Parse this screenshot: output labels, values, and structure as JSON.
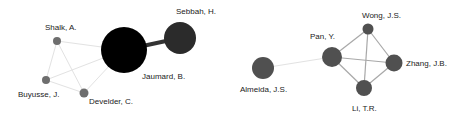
{
  "networks": [
    {
      "nodes": [
        {
          "id": "shalk",
          "label": "Shalk, A.",
          "x": 57,
          "y": 41,
          "r": 4,
          "color": "#6e6e6e"
        },
        {
          "id": "buyusse",
          "label": "Buyusse, J.",
          "x": 46,
          "y": 80,
          "r": 4,
          "color": "#6e6e6e"
        },
        {
          "id": "develder",
          "label": "Develder, C.",
          "x": 84,
          "y": 93,
          "r": 4.5,
          "color": "#6e6e6e"
        },
        {
          "id": "jaumard",
          "label": "Jaumard, B.",
          "x": 124,
          "y": 50,
          "r": 23,
          "color": "#000000"
        },
        {
          "id": "sebbah",
          "label": "Sebbah, H.",
          "x": 180,
          "y": 38,
          "r": 16,
          "color": "#2b2b2b"
        }
      ],
      "edges": [
        {
          "from": "jaumard",
          "to": "sebbah",
          "width": 4,
          "color": "#333333"
        },
        {
          "from": "shalk",
          "to": "jaumard",
          "width": 1,
          "color": "#e2e2e2"
        },
        {
          "from": "buyusse",
          "to": "jaumard",
          "width": 1,
          "color": "#e2e2e2"
        },
        {
          "from": "develder",
          "to": "jaumard",
          "width": 1,
          "color": "#e2e2e2"
        },
        {
          "from": "shalk",
          "to": "buyusse",
          "width": 1,
          "color": "#e2e2e2"
        },
        {
          "from": "shalk",
          "to": "develder",
          "width": 1,
          "color": "#e2e2e2"
        },
        {
          "from": "buyusse",
          "to": "develder",
          "width": 1,
          "color": "#e2e2e2"
        }
      ]
    },
    {
      "nodes": [
        {
          "id": "almeida",
          "label": "Almeida, J.S.",
          "x": 263,
          "y": 68,
          "r": 11,
          "color": "#505050"
        },
        {
          "id": "pan",
          "label": "Pan, Y.",
          "x": 332,
          "y": 57,
          "r": 10,
          "color": "#505050"
        },
        {
          "id": "wong",
          "label": "Wong, J.S.",
          "x": 368,
          "y": 29,
          "r": 5.5,
          "color": "#505050"
        },
        {
          "id": "zhang",
          "label": "Zhang, J.B.",
          "x": 394,
          "y": 63,
          "r": 8.5,
          "color": "#505050"
        },
        {
          "id": "li",
          "label": "Li, T.R.",
          "x": 364,
          "y": 88,
          "r": 8,
          "color": "#505050"
        }
      ],
      "edges": [
        {
          "from": "almeida",
          "to": "pan",
          "width": 1,
          "color": "#e2e2e2"
        },
        {
          "from": "pan",
          "to": "wong",
          "width": 1.2,
          "color": "#a8a8a8"
        },
        {
          "from": "pan",
          "to": "zhang",
          "width": 1.2,
          "color": "#a8a8a8"
        },
        {
          "from": "pan",
          "to": "li",
          "width": 1.2,
          "color": "#a8a8a8"
        },
        {
          "from": "wong",
          "to": "zhang",
          "width": 1.2,
          "color": "#a8a8a8"
        },
        {
          "from": "wong",
          "to": "li",
          "width": 1.2,
          "color": "#a8a8a8"
        },
        {
          "from": "zhang",
          "to": "li",
          "width": 1.2,
          "color": "#a8a8a8"
        }
      ]
    }
  ],
  "labels": [
    {
      "node": "shalk",
      "text": "Shalk, A.",
      "x": 45,
      "y": 30
    },
    {
      "node": "buyusse",
      "text": "Buyusse, J.",
      "x": 18,
      "y": 97
    },
    {
      "node": "develder",
      "text": "Develder, C.",
      "x": 89,
      "y": 104
    },
    {
      "node": "jaumard",
      "text": "Jaumard, B.",
      "x": 142,
      "y": 79
    },
    {
      "node": "sebbah",
      "text": "Sebbah, H.",
      "x": 176,
      "y": 14
    },
    {
      "node": "almeida",
      "text": "Almeida, J.S.",
      "x": 240,
      "y": 92
    },
    {
      "node": "pan",
      "text": "Pan, Y.",
      "x": 310,
      "y": 39
    },
    {
      "node": "wong",
      "text": "Wong, J.S.",
      "x": 362,
      "y": 18
    },
    {
      "node": "zhang",
      "text": "Zhang, J.B.",
      "x": 406,
      "y": 66
    },
    {
      "node": "li",
      "text": "Li, T.R.",
      "x": 352,
      "y": 111
    }
  ]
}
